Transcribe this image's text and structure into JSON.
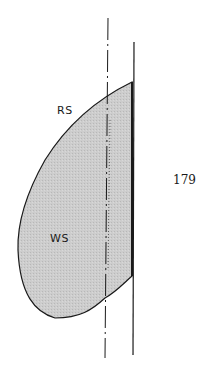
{
  "diagram": {
    "regions": [
      {
        "label": "RS",
        "x": 57,
        "y": 104
      },
      {
        "label": "WS",
        "x": 50,
        "y": 232
      }
    ],
    "page_number": "179",
    "colors": {
      "fill": "#c8c8c8",
      "stroke": "#1a1a1a",
      "background": "#ffffff"
    }
  }
}
